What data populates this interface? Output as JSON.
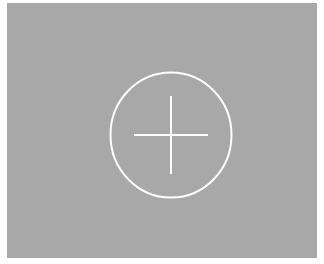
{
  "panel": {
    "background_color": "#a8a8a8"
  },
  "add_button": {
    "icon": "plus-circle-icon",
    "stroke_color": "#ffffff"
  }
}
